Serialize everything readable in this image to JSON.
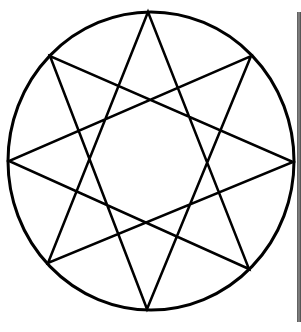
{
  "diagram": {
    "title": "",
    "shape": "circle-inscribed-octagram",
    "stroke_color": "#000000",
    "background_color": "#ffffff",
    "circle": {
      "cx": 151,
      "cy": 161,
      "rx": 143,
      "ry": 149,
      "stroke_width": 3
    },
    "star": {
      "type": "{8/3} octagram",
      "stroke_width": 2.5,
      "vertices": [
        {
          "name": "top",
          "x": 148,
          "y": 12
        },
        {
          "name": "upper-right",
          "x": 251,
          "y": 56
        },
        {
          "name": "right",
          "x": 293,
          "y": 162
        },
        {
          "name": "lower-right",
          "x": 249,
          "y": 269
        },
        {
          "name": "bottom",
          "x": 147,
          "y": 309
        },
        {
          "name": "lower-left",
          "x": 48,
          "y": 263
        },
        {
          "name": "left",
          "x": 9,
          "y": 161
        },
        {
          "name": "upper-left",
          "x": 50,
          "y": 56
        }
      ],
      "step": 3
    }
  }
}
